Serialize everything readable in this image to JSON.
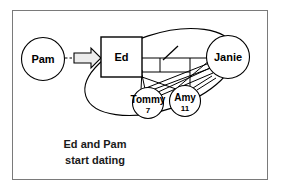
{
  "figure": {
    "border_color": "#7a7a7a",
    "background": "#ffffff",
    "line_color": "#000000"
  },
  "nodes": {
    "pam": {
      "label": "Pam",
      "shape": "circle",
      "cx": 43,
      "cy": 59,
      "r": 21.5,
      "font_size": 11
    },
    "ed": {
      "label": "Ed",
      "shape": "rectangle",
      "x": 101,
      "y": 37,
      "width": 41,
      "height": 40,
      "font_size": 11
    },
    "janie": {
      "label": "Janie",
      "shape": "circle",
      "cx": 228,
      "cy": 57,
      "r": 21.5,
      "font_size": 11
    },
    "tommy": {
      "label": "Tommy",
      "sublabel": "7",
      "shape": "circle",
      "cx": 148,
      "cy": 103,
      "r": 15.5,
      "font_size": 10,
      "sub_font_size": 8
    },
    "amy": {
      "label": "Amy",
      "sublabel": "11",
      "shape": "circle",
      "cx": 185,
      "cy": 101,
      "r": 15.5,
      "font_size": 10,
      "sub_font_size": 8
    }
  },
  "grouping_ellipse": {
    "name": "family-grouping-ellipse",
    "cx": 160,
    "cy": 72,
    "rx": 78,
    "ry": 38,
    "rotation": -18
  },
  "arrow": {
    "name": "pam-to-ed-arrow",
    "style": "block-outline",
    "dashed_stub": true,
    "from": "pam",
    "to": "ed"
  },
  "caption": {
    "line1": "Ed and Pam",
    "line2": "start dating",
    "font_size": 11,
    "x": 95,
    "y1": 145,
    "y2": 161
  },
  "edges": [
    {
      "name": "ed-to-janie",
      "from": "ed",
      "to": "janie"
    },
    {
      "name": "ed-to-tommy",
      "from": "ed",
      "to": "tommy"
    },
    {
      "name": "ed-to-amy",
      "from": "ed",
      "to": "amy"
    },
    {
      "name": "janie-to-tommy",
      "from": "janie",
      "to": "tommy"
    },
    {
      "name": "janie-to-amy",
      "from": "janie",
      "to": "amy"
    },
    {
      "name": "tommy-to-amy",
      "from": "tommy",
      "to": "amy"
    }
  ]
}
